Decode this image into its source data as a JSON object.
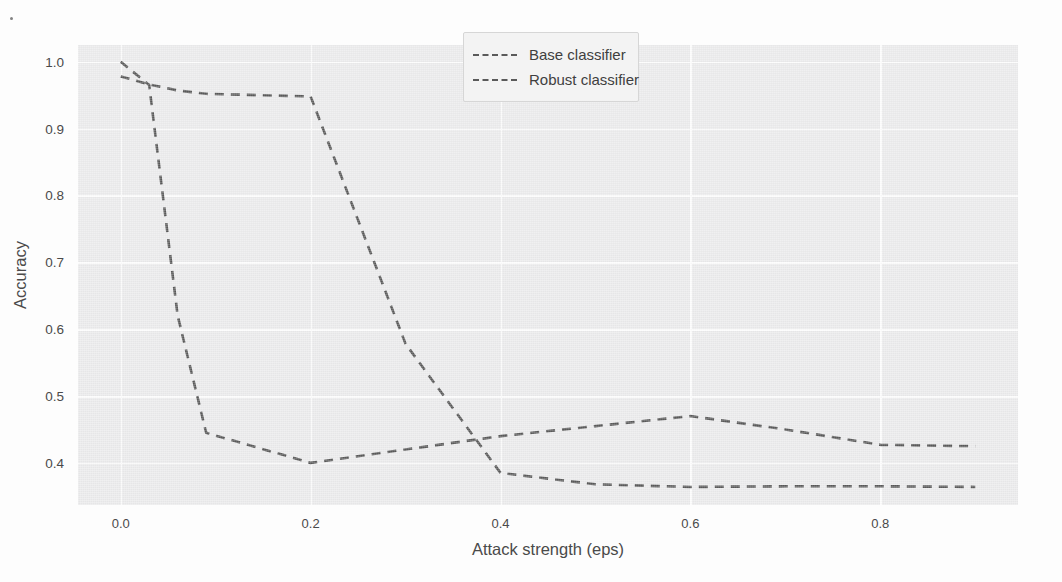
{
  "chart_data": {
    "type": "line",
    "title": "",
    "xlabel": "Attack strength (eps)",
    "ylabel": "Accuracy",
    "xlim": [
      -0.045,
      0.945
    ],
    "ylim": [
      0.337,
      1.025
    ],
    "xticks": [
      0.0,
      0.2,
      0.4,
      0.6,
      0.8
    ],
    "xticklabels": [
      "0.0",
      "0.2",
      "0.4",
      "0.6",
      "0.8"
    ],
    "yticks": [
      0.4,
      0.5,
      0.6,
      0.7,
      0.8,
      0.9,
      1.0
    ],
    "yticklabels": [
      "0.4",
      "0.5",
      "0.6",
      "0.7",
      "0.8",
      "0.9",
      "1.0"
    ],
    "grid": true,
    "legend_position": "upper center",
    "linestyle": "dashed",
    "plot_background": "#ececed",
    "grid_color": "#fdfdfd",
    "line_color": "#5a5a5a",
    "x": [
      0.0,
      0.03,
      0.06,
      0.09,
      0.2,
      0.3,
      0.4,
      0.5,
      0.6,
      0.7,
      0.8,
      0.9
    ],
    "series": [
      {
        "name": "Base classifier",
        "values": [
          1.0,
          0.965,
          0.62,
          0.445,
          0.4,
          0.42,
          0.44,
          0.455,
          0.47,
          0.45,
          0.427,
          0.425
        ]
      },
      {
        "name": "Robust classifier",
        "values": [
          0.978,
          0.966,
          0.957,
          0.952,
          0.948,
          0.578,
          0.385,
          0.368,
          0.364,
          0.365,
          0.365,
          0.364
        ]
      }
    ]
  },
  "legend": {
    "items": [
      {
        "label": "Base classifier"
      },
      {
        "label": "Robust classifier"
      }
    ]
  }
}
